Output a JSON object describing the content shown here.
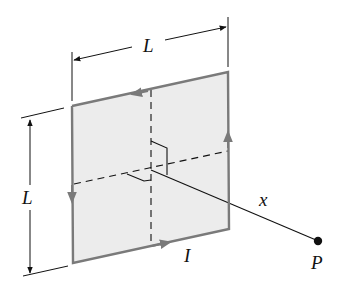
{
  "figure": {
    "labels": {
      "top_side": "L",
      "left_side": "L",
      "distance": "x",
      "current": "I",
      "point": "P"
    },
    "colors": {
      "loop_fill": "#ececec",
      "loop_edge": "#7a7a7a",
      "ink": "#111111"
    }
  }
}
